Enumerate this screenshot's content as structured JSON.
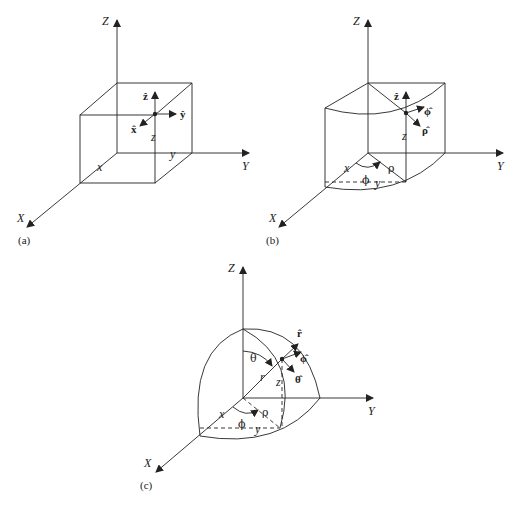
{
  "figure": {
    "panels": [
      {
        "id": "a",
        "caption": "(a)",
        "system": "cartesian",
        "axes": {
          "x": "X",
          "y": "Y",
          "z": "Z"
        },
        "coords": {
          "x": "x",
          "y": "y",
          "z": "z"
        },
        "unit_vectors": {
          "x": "x̂",
          "y": "ŷ",
          "z": "ẑ"
        }
      },
      {
        "id": "b",
        "caption": "(b)",
        "system": "cylindrical",
        "axes": {
          "x": "X",
          "y": "Y",
          "z": "Z"
        },
        "coords": {
          "x": "x",
          "y": "y",
          "z": "z",
          "rho": "ρ",
          "phi": "ϕ"
        },
        "unit_vectors": {
          "z": "ẑ",
          "phi": "ϕ̂",
          "rho": "ρ̂"
        }
      },
      {
        "id": "c",
        "caption": "(c)",
        "system": "spherical",
        "axes": {
          "x": "X",
          "y": "Y",
          "z": "Z"
        },
        "coords": {
          "x": "x",
          "y": "y",
          "z": "z",
          "r": "r",
          "rho": "ρ",
          "phi": "ϕ",
          "theta": "θ"
        },
        "unit_vectors": {
          "r": "r̂",
          "phi": "ϕ̂",
          "theta": "θ̂"
        }
      }
    ]
  }
}
